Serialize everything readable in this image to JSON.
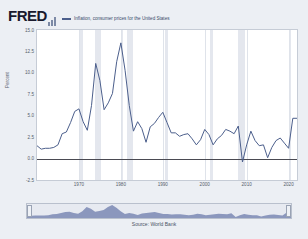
{
  "brand": {
    "logo_text": "FRED",
    "logo_icon": "bar-chart-icon"
  },
  "legend": {
    "series_label": "Inflation, consumer prices for the United States",
    "series_color": "#4c5f8c"
  },
  "source": {
    "text": "Source: World Bank"
  },
  "navigator": {
    "left_handle": "range-start-handle",
    "right_handle": "range-end-handle",
    "fill_color": "#8b97bd"
  },
  "chart_data": {
    "type": "line",
    "title": "Inflation, consumer prices for the United States",
    "xlabel": "",
    "ylabel": "Percent",
    "xlim": [
      1960,
      2022
    ],
    "ylim": [
      -2.5,
      15.0
    ],
    "grid": true,
    "legend_position": "top",
    "y_ticks": [
      "15.0",
      "12.5",
      "10.0",
      "7.5",
      "5.0",
      "2.5",
      "0.0",
      "-2.5"
    ],
    "y_tick_values": [
      15.0,
      12.5,
      10.0,
      7.5,
      5.0,
      2.5,
      0.0,
      -2.5
    ],
    "x_ticks": [
      "1970",
      "1980",
      "1990",
      "2000",
      "2010",
      "2020"
    ],
    "x_tick_values": [
      1970,
      1980,
      1990,
      2000,
      2010,
      2020
    ],
    "zero_line": 0.0,
    "recession_bands": [
      [
        1969.9,
        1970.9
      ],
      [
        1973.9,
        1975.2
      ],
      [
        1980.0,
        1980.6
      ],
      [
        1981.5,
        1982.9
      ],
      [
        1990.5,
        1991.2
      ],
      [
        2001.2,
        2001.9
      ],
      [
        2007.9,
        2009.5
      ],
      [
        2020.1,
        2020.5
      ]
    ],
    "series": [
      {
        "name": "Inflation, consumer prices for the United States",
        "color": "#4c5f8c",
        "x": [
          1960,
          1961,
          1962,
          1963,
          1964,
          1965,
          1966,
          1967,
          1968,
          1969,
          1970,
          1971,
          1972,
          1973,
          1974,
          1975,
          1976,
          1977,
          1978,
          1979,
          1980,
          1981,
          1982,
          1983,
          1984,
          1985,
          1986,
          1987,
          1988,
          1989,
          1990,
          1991,
          1992,
          1993,
          1994,
          1995,
          1996,
          1997,
          1998,
          1999,
          2000,
          2001,
          2002,
          2003,
          2004,
          2005,
          2006,
          2007,
          2008,
          2009,
          2010,
          2011,
          2012,
          2013,
          2014,
          2015,
          2016,
          2017,
          2018,
          2019,
          2020,
          2021,
          2022
        ],
        "values": [
          1.5,
          1.1,
          1.2,
          1.2,
          1.3,
          1.6,
          2.9,
          3.1,
          4.2,
          5.5,
          5.8,
          4.3,
          3.3,
          6.2,
          11.1,
          9.1,
          5.7,
          6.5,
          7.6,
          11.3,
          13.5,
          10.3,
          6.2,
          3.2,
          4.3,
          3.5,
          1.9,
          3.7,
          4.1,
          4.8,
          5.4,
          4.2,
          3.0,
          3.0,
          2.6,
          2.8,
          2.9,
          2.3,
          1.6,
          2.2,
          3.4,
          2.8,
          1.6,
          2.3,
          2.7,
          3.4,
          3.2,
          2.9,
          3.8,
          -0.4,
          1.6,
          3.2,
          2.1,
          1.5,
          1.6,
          0.1,
          1.3,
          2.1,
          2.4,
          1.8,
          1.2,
          4.7,
          4.7
        ]
      }
    ]
  }
}
